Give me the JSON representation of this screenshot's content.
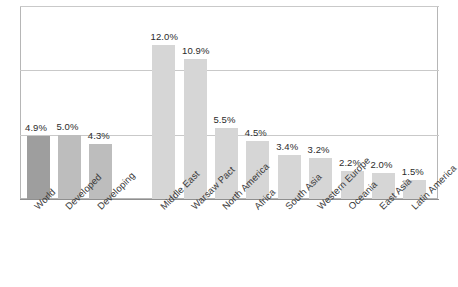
{
  "chart_data": {
    "type": "bar",
    "title": "",
    "subtitle": "",
    "xlabel": "",
    "ylabel": "",
    "ylim": [
      0,
      15
    ],
    "grid": true,
    "gridlines": [
      5,
      10,
      15
    ],
    "legend": "none",
    "value_suffix": "%",
    "categories": [
      "World",
      "Developed",
      "Developing",
      "Middle East",
      "Warsaw Pact",
      "North America",
      "Africa",
      "South Asia",
      "Western Europe",
      "Oceania",
      "East Asia",
      "Latin America"
    ],
    "values": [
      4.9,
      5.0,
      4.3,
      12.0,
      10.9,
      5.5,
      4.5,
      3.4,
      3.2,
      2.2,
      2.0,
      1.5
    ],
    "data_labels": [
      "4.9%",
      "5.0%",
      "4.3%",
      "12.0%",
      "10.9%",
      "5.5%",
      "4.5%",
      "3.4%",
      "3.2%",
      "2.2%",
      "2.0%",
      "1.5%"
    ],
    "groups": [
      "world",
      "group",
      "group",
      "region",
      "region",
      "region",
      "region",
      "region",
      "region",
      "region",
      "region",
      "region"
    ],
    "gap_after_index": 2
  },
  "colors": {
    "bar_world": "#9e9e9e",
    "bar_group": "#bdbdbd",
    "bar_region": "#d6d6d6",
    "gridline": "#c9c9c9",
    "frame": "#b6b6b6",
    "baseline": "#8f8f8f",
    "text": "#2b2b2b",
    "background": "#ffffff"
  }
}
